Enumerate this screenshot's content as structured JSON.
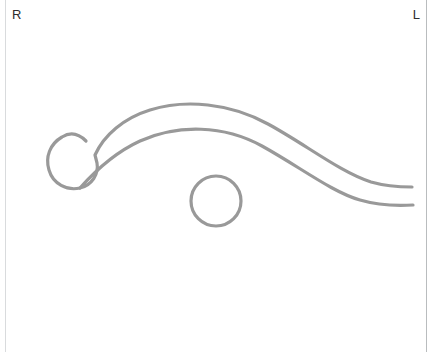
{
  "canvas": {
    "width": 434,
    "height": 352,
    "background": "#ffffff",
    "frame_color_left": "#d9dbdd",
    "frame_color_right": "#b9bcbe"
  },
  "labels": {
    "right_marker": "R",
    "left_marker": "L"
  },
  "style": {
    "stroke_color": "#999999",
    "stroke_width": 3.2,
    "label_color": "#2e2e2e",
    "label_font_size": 13
  },
  "shapes": [
    {
      "name": "bulb-and-upper-contour",
      "type": "path",
      "description": "rounded bulb at left opening into a long upward-arcing contour ending at right",
      "d": "M 86 141 C 78 133 70 132 62 137 C 50 144 45 157 49 170 C 53 184 67 191 80 188 C 92 185 99 174 97 163 L 95 155 C 104 135 124 118 150 110 C 185 99 230 103 268 124 C 305 144 340 172 371 182 C 385 186 399 187 412 187"
    },
    {
      "name": "lower-contour",
      "type": "path",
      "description": "second parallel contour running beneath the upper one",
      "d": "M 80 188 C 96 170 116 152 140 141 C 178 124 224 125 262 146 C 300 167 332 192 360 200 C 377 205 397 206 413 205"
    },
    {
      "name": "circle-marker",
      "type": "circle",
      "cx": 216,
      "cy": 201,
      "r": 25
    }
  ]
}
